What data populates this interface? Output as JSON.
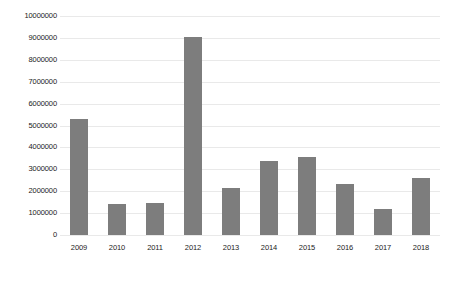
{
  "chart_data": {
    "type": "bar",
    "title": "",
    "subtitle": "",
    "xlabel": "",
    "ylabel": "",
    "categories": [
      "2009",
      "2010",
      "2011",
      "2012",
      "2013",
      "2014",
      "2015",
      "2016",
      "2017",
      "2018"
    ],
    "values": [
      5300000,
      1400000,
      1450000,
      9050000,
      2150000,
      3400000,
      3550000,
      2350000,
      1200000,
      2600000
    ],
    "series": [
      {
        "name": "",
        "values": [
          5300000,
          1400000,
          1450000,
          9050000,
          2150000,
          3400000,
          3550000,
          2350000,
          1200000,
          2600000
        ]
      }
    ],
    "ylim": [
      0,
      10000000
    ],
    "y_ticks": [
      0,
      1000000,
      2000000,
      3000000,
      4000000,
      5000000,
      6000000,
      7000000,
      8000000,
      9000000,
      10000000
    ],
    "y_tick_labels": [
      "0",
      "1000000",
      "2000000",
      "3000000",
      "4000000",
      "5000000",
      "6000000",
      "7000000",
      "8000000",
      "9000000",
      "10000000"
    ],
    "grid": true,
    "grid_axis": "y",
    "legend": false,
    "legend_position": "none",
    "bar_color": "#7d7d7d",
    "grid_color": "#e9e9e9",
    "text_color": "#1b1b1b",
    "background_color": "#ffffff",
    "annotations": []
  }
}
